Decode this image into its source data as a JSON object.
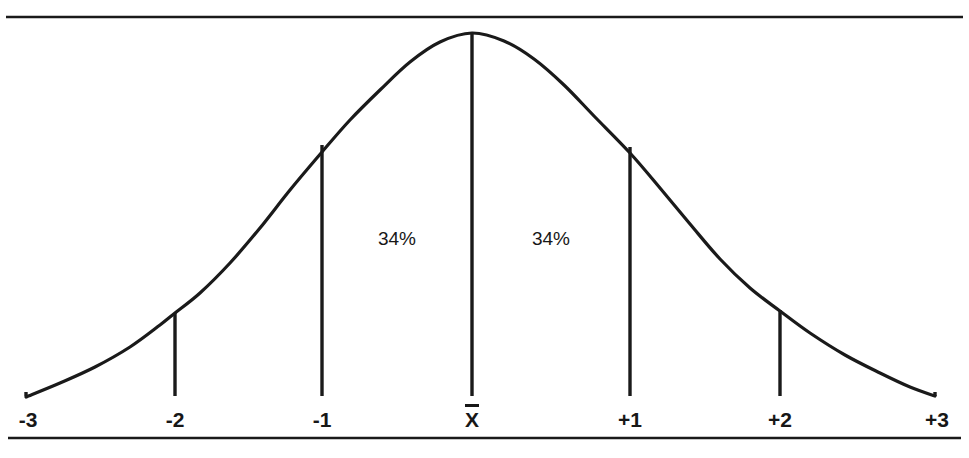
{
  "figure": {
    "title": "",
    "background_color": "#ffffff",
    "ink_color": "#1a1a1a",
    "top_rule": {
      "y": 17,
      "x1": 6,
      "x2": 963,
      "thickness": 2.4
    },
    "bottom_rule": {
      "y": 438,
      "x1": 8,
      "x2": 961,
      "thickness": 2.6
    }
  },
  "chart_data": {
    "type": "line",
    "title": "",
    "subtitle": "",
    "xlabel": "",
    "ylabel": "",
    "grid": false,
    "legend": "none",
    "distribution": "normal",
    "xlim": [
      -3,
      3
    ],
    "ylim": [
      0,
      1
    ],
    "x_tick_labels": [
      "-3",
      "-2",
      "-1",
      "X̄",
      "+1",
      "+2",
      "+3"
    ],
    "x_tick_values": [
      -3,
      -2,
      -1,
      0,
      1,
      2,
      3
    ],
    "curve_points_px": [
      [
        26,
        397
      ],
      [
        60,
        383
      ],
      [
        95,
        367
      ],
      [
        130,
        347
      ],
      [
        160,
        325
      ],
      [
        175,
        313
      ],
      [
        200,
        293
      ],
      [
        230,
        263
      ],
      [
        260,
        228
      ],
      [
        290,
        190
      ],
      [
        322,
        152
      ],
      [
        350,
        120
      ],
      [
        380,
        90
      ],
      [
        410,
        62
      ],
      [
        440,
        42
      ],
      [
        472,
        33
      ],
      [
        504,
        41
      ],
      [
        534,
        59
      ],
      [
        564,
        85
      ],
      [
        594,
        116
      ],
      [
        630,
        153
      ],
      [
        660,
        188
      ],
      [
        690,
        224
      ],
      [
        720,
        259
      ],
      [
        750,
        288
      ],
      [
        780,
        311
      ],
      [
        810,
        333
      ],
      [
        845,
        355
      ],
      [
        880,
        373
      ],
      [
        910,
        387
      ],
      [
        935,
        396
      ]
    ],
    "droplines": [
      {
        "label": "-2",
        "x_px": 175,
        "y_top_px": 313,
        "y_bottom_px": 396
      },
      {
        "label": "-1",
        "x_px": 322,
        "y_top_px": 145,
        "y_bottom_px": 396
      },
      {
        "label": "X̄",
        "x_px": 472,
        "y_top_px": 33,
        "y_bottom_px": 396
      },
      {
        "label": "+1",
        "x_px": 630,
        "y_top_px": 147,
        "y_bottom_px": 396
      },
      {
        "label": "+2",
        "x_px": 780,
        "y_top_px": 310,
        "y_bottom_px": 396
      }
    ],
    "tick_marks": [
      {
        "label": "-3",
        "x_px": 26
      },
      {
        "label": "+3",
        "x_px": 935
      }
    ],
    "axis_labels": [
      {
        "text": "-3",
        "x_px": 28,
        "y_px": 420
      },
      {
        "text": "-2",
        "x_px": 175,
        "y_px": 420
      },
      {
        "text": "-1",
        "x_px": 322,
        "y_px": 420
      },
      {
        "text": "X̄",
        "x_px": 472,
        "y_px": 420,
        "is_xbar": true
      },
      {
        "text": "+1",
        "x_px": 630,
        "y_px": 420
      },
      {
        "text": "+2",
        "x_px": 780,
        "y_px": 420
      },
      {
        "text": "+3",
        "x_px": 937,
        "y_px": 420
      }
    ],
    "annotations": [
      {
        "text": "34%",
        "x_px": 397,
        "y_px": 239,
        "region": "between mean and -1 SD"
      },
      {
        "text": "34%",
        "x_px": 551,
        "y_px": 239,
        "region": "between mean and +1 SD"
      }
    ],
    "mean_symbol": "X̄",
    "mean_label_parts": {
      "glyph": "X",
      "overbar": true
    }
  }
}
